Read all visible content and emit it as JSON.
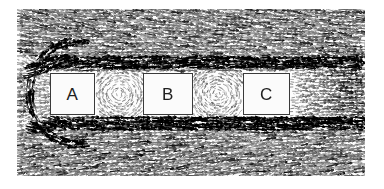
{
  "figure": {
    "kind": "velocity-vector-field",
    "title": "",
    "caption": "",
    "background_color": "#ffffff",
    "field_color": "#1a1a1a",
    "panel": {
      "left": 17,
      "top": 9,
      "width": 348,
      "height": 167
    }
  },
  "obstacles": [
    {
      "label": "A",
      "x": 50,
      "y": 73,
      "width": 45,
      "height": 42,
      "fill": "#fbfbfb",
      "stroke": "#3a3a3a"
    },
    {
      "label": "B",
      "x": 143,
      "y": 73,
      "width": 50,
      "height": 42,
      "fill": "#fbfbfb",
      "stroke": "#3a3a3a"
    },
    {
      "label": "C",
      "x": 243,
      "y": 73,
      "width": 47,
      "height": 42,
      "fill": "#fbfbfb",
      "stroke": "#3a3a3a"
    }
  ],
  "chart_data": {
    "type": "scatter",
    "subtype": "vector-field",
    "title": "",
    "xlabel": "",
    "ylabel": "",
    "xlim": [
      0,
      348
    ],
    "ylim": [
      0,
      167
    ],
    "grid": false,
    "legend": null,
    "annotations": [
      "A",
      "B",
      "C"
    ],
    "flow_direction": "left-to-right",
    "regions": [
      {
        "name": "upstream-freestream",
        "x_range": [
          0,
          35
        ],
        "y_range": [
          0,
          167
        ],
        "vector_density": "high",
        "mean_angle_deg": 0,
        "mean_magnitude": 1.0
      },
      {
        "name": "upper-freestream",
        "x_range": [
          0,
          348
        ],
        "y_range": [
          0,
          45
        ],
        "vector_density": "high",
        "mean_angle_deg": 0,
        "mean_magnitude": 1.0
      },
      {
        "name": "lower-freestream",
        "x_range": [
          0,
          348
        ],
        "y_range": [
          120,
          167
        ],
        "vector_density": "high",
        "mean_angle_deg": 0,
        "mean_magnitude": 1.0
      },
      {
        "name": "upper-shear-layer",
        "x_range": [
          30,
          330
        ],
        "y_range": [
          55,
          70
        ],
        "vector_density": "very-high",
        "mean_angle_deg": -3,
        "mean_magnitude": 1.15
      },
      {
        "name": "lower-shear-layer",
        "x_range": [
          30,
          330
        ],
        "y_range": [
          115,
          128
        ],
        "vector_density": "very-high",
        "mean_angle_deg": 3,
        "mean_magnitude": 1.1
      },
      {
        "name": "stagnation-front-A",
        "x_range": [
          25,
          50
        ],
        "y_range": [
          60,
          130
        ],
        "vector_density": "medium",
        "mean_angle_deg": 0,
        "mean_magnitude": 0.45
      },
      {
        "name": "gap-A-B-recirculation",
        "x_range": [
          95,
          143
        ],
        "y_range": [
          73,
          118
        ],
        "vector_density": "low",
        "mean_angle_deg": 180,
        "mean_magnitude": 0.3
      },
      {
        "name": "gap-B-C-recirculation",
        "x_range": [
          193,
          243
        ],
        "y_range": [
          73,
          118
        ],
        "vector_density": "low",
        "mean_angle_deg": 180,
        "mean_magnitude": 0.3
      },
      {
        "name": "near-wake-C",
        "x_range": [
          290,
          348
        ],
        "y_range": [
          70,
          120
        ],
        "vector_density": "medium",
        "mean_angle_deg": 5,
        "mean_magnitude": 0.5
      }
    ],
    "notes": [
      "Vectors are rendered as short dark line segments with small arrow heads.",
      "No axes, ticks, gridlines, colorbar or legend are drawn in the figure.",
      "Obstacle interiors are masked white and carry only their letter label."
    ]
  }
}
